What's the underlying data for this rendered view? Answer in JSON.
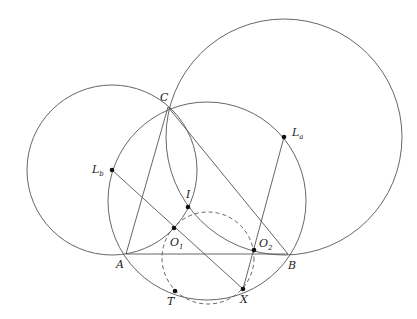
{
  "figure": {
    "stroke_color": "#555555",
    "point_color": "#111111",
    "background": "#ffffff"
  },
  "points": {
    "C": {
      "label": "C",
      "sub": "",
      "x": 168,
      "y": 107,
      "lx": 160,
      "ly": 101,
      "dot": false
    },
    "A": {
      "label": "A",
      "sub": "",
      "x": 126,
      "y": 254,
      "lx": 116,
      "ly": 268,
      "dot": false
    },
    "B": {
      "label": "B",
      "sub": "",
      "x": 288,
      "y": 254,
      "lx": 288,
      "ly": 269,
      "dot": false
    },
    "La": {
      "label": "L",
      "sub": "a",
      "x": 284,
      "y": 137,
      "lx": 292,
      "ly": 136,
      "dot": true
    },
    "Lb": {
      "label": "L",
      "sub": "b",
      "x": 112,
      "y": 170,
      "lx": 92,
      "ly": 173,
      "dot": true
    },
    "I": {
      "label": "I",
      "sub": "",
      "x": 188,
      "y": 207,
      "lx": 186,
      "ly": 198,
      "dot": true
    },
    "O1": {
      "label": "O",
      "sub": "1",
      "x": 174,
      "y": 228,
      "lx": 170,
      "ly": 246,
      "dot": true
    },
    "O2": {
      "label": "O",
      "sub": "2",
      "x": 254,
      "y": 250,
      "lx": 259,
      "ly": 247,
      "dot": true
    },
    "X": {
      "label": "X",
      "sub": "",
      "x": 243,
      "y": 289,
      "lx": 240,
      "ly": 303,
      "dot": true
    },
    "T": {
      "label": "T",
      "sub": "",
      "x": 175,
      "y": 291,
      "lx": 167,
      "ly": 305,
      "dot": true
    }
  },
  "circles": [
    {
      "name": "circumcircle-ABC",
      "cx": 207,
      "cy": 201,
      "r": 99,
      "dashed": false
    },
    {
      "name": "circle-centered-Lb",
      "cx": 112,
      "cy": 170,
      "r": 85,
      "dashed": false
    },
    {
      "name": "circle-centered-La",
      "cx": 284,
      "cy": 137,
      "r": 118,
      "dashed": false
    },
    {
      "name": "dashed-circle-O1-O2-X-T",
      "cx": 208,
      "cy": 258,
      "r": 46,
      "dashed": true
    }
  ],
  "segments": [
    {
      "name": "segment-AB",
      "from": "A",
      "to": "B"
    },
    {
      "name": "segment-AC",
      "from": "A",
      "to": "C"
    },
    {
      "name": "segment-CB",
      "from": "C",
      "to": "B"
    },
    {
      "name": "segment-Lb-X",
      "from": "Lb",
      "to": "X"
    },
    {
      "name": "segment-La-X",
      "from": "La",
      "to": "X"
    }
  ]
}
